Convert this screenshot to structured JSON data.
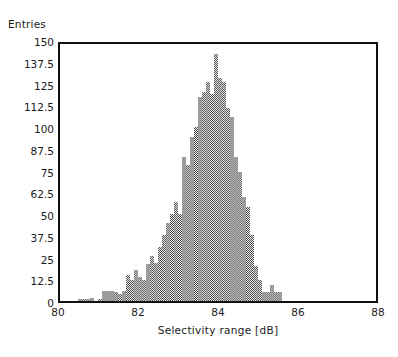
{
  "chart_data": {
    "type": "bar",
    "title": "",
    "subtitle": "",
    "xlabel": "Selectivity  range  [dB]",
    "ylabel": "Entries",
    "grid": false,
    "legend": null,
    "xlim": [
      80,
      88
    ],
    "ylim": [
      0,
      150
    ],
    "xticks": [
      80,
      82,
      84,
      86,
      88
    ],
    "xtick_labels": [
      "80",
      "82",
      "84",
      "86",
      "88"
    ],
    "yticks": [
      0,
      12.5,
      25,
      37.5,
      50,
      62.5,
      75,
      87.5,
      100,
      112.5,
      125,
      137.5,
      150
    ],
    "ytick_labels": [
      "0",
      "12.5",
      "25",
      "37.5",
      "50",
      "62.5",
      "75",
      "87.5",
      "100",
      "112.5",
      "125",
      "137.5",
      "150"
    ],
    "bin_width": 0.1,
    "bar_color": "#3a3a3a",
    "bar_fill": "cross-hatch-dither",
    "x": [
      80.5,
      80.6,
      80.7,
      80.8,
      80.9,
      81.0,
      81.1,
      81.2,
      81.3,
      81.4,
      81.5,
      81.6,
      81.7,
      81.8,
      81.9,
      82.0,
      82.1,
      82.2,
      82.3,
      82.4,
      82.5,
      82.6,
      82.7,
      82.8,
      82.9,
      83.0,
      83.1,
      83.2,
      83.3,
      83.4,
      83.5,
      83.6,
      83.7,
      83.8,
      83.9,
      84.0,
      84.1,
      84.2,
      84.3,
      84.4,
      84.5,
      84.6,
      84.7,
      84.8,
      84.9,
      85.0,
      85.1,
      85.2,
      85.3,
      85.4,
      85.5,
      85.6,
      85.7,
      85.8,
      85.9,
      86.0,
      86.1,
      86.2,
      86.3,
      86.4,
      86.5,
      86.6,
      86.7,
      86.8
    ],
    "values": [
      1,
      1,
      1,
      2,
      0,
      1,
      6,
      6,
      6,
      5,
      4,
      6,
      15,
      12,
      18,
      14,
      12,
      21,
      26,
      22,
      31,
      38,
      45,
      50,
      57,
      50,
      83,
      78,
      94,
      100,
      117,
      120,
      126,
      119,
      142,
      128,
      126,
      111,
      106,
      83,
      74,
      60,
      54,
      38,
      20,
      12,
      5,
      5,
      9,
      5,
      5,
      0,
      0,
      0,
      0,
      0,
      0,
      0,
      0,
      0,
      0,
      0,
      0,
      0
    ]
  },
  "axes": {
    "ylabel_text": "Entries",
    "xlabel_text": "Selectivity  range  [dB]"
  }
}
